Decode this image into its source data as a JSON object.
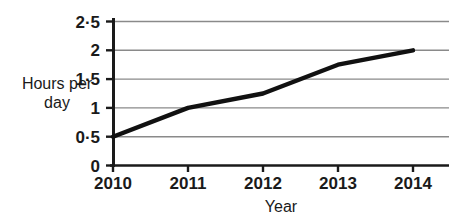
{
  "chart_data": {
    "type": "line",
    "title": "",
    "xlabel": "Year",
    "ylabel": "Hours per day",
    "ylabel_line1": "Hours per",
    "ylabel_line2": "day",
    "categories": [
      "2010",
      "2011",
      "2012",
      "2013",
      "2014"
    ],
    "x": [
      2010,
      2011,
      2012,
      2013,
      2014
    ],
    "values": [
      0.5,
      1,
      1.25,
      1.75,
      2
    ],
    "series": [
      {
        "name": "Hours per day",
        "values": [
          0.5,
          1,
          1.25,
          1.75,
          2
        ]
      }
    ],
    "xlim": [
      2010,
      2014
    ],
    "ylim": [
      0,
      2.5
    ],
    "ytick_values": [
      0,
      0.5,
      1,
      1.5,
      2,
      2.5
    ],
    "ytick_labels": [
      "0",
      "0·5",
      "1",
      "1·5",
      "2",
      "2·5"
    ],
    "xtick_labels": [
      "2010",
      "2011",
      "2012",
      "2013",
      "2014"
    ],
    "grid": "horizontal",
    "legend": "none",
    "line_color": "#111111",
    "grid_color": "#8a8a8a",
    "axis_color": "#1a1a1a",
    "background_color": "#ffffff"
  },
  "axes": {
    "x_title": "Year",
    "y_title_line1": "Hours per",
    "y_title_line2": "day"
  },
  "ticks": {
    "y": [
      {
        "label": "2·5",
        "value": 2.5
      },
      {
        "label": "2",
        "value": 2
      },
      {
        "label": "1·5",
        "value": 1.5
      },
      {
        "label": "1",
        "value": 1
      },
      {
        "label": "0·5",
        "value": 0.5
      },
      {
        "label": "0",
        "value": 0
      }
    ],
    "x": [
      {
        "label": "2010",
        "value": 2010
      },
      {
        "label": "2011",
        "value": 2011
      },
      {
        "label": "2012",
        "value": 2012
      },
      {
        "label": "2013",
        "value": 2013
      },
      {
        "label": "2014",
        "value": 2014
      }
    ]
  }
}
